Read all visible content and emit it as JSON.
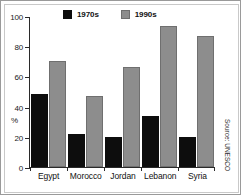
{
  "chart_data": {
    "type": "bar",
    "title": "",
    "xlabel": "",
    "ylabel": "%",
    "ylim": [
      0,
      100
    ],
    "yticks": [
      0,
      20,
      40,
      60,
      80,
      100
    ],
    "grid": false,
    "legend_position": "top",
    "categories": [
      "Egypt",
      "Morocco",
      "Jordan",
      "Lebanon",
      "Syria"
    ],
    "series": [
      {
        "name": "1970s",
        "color": "#0d0d0d",
        "values": [
          48.5,
          22,
          20,
          34,
          20
        ]
      },
      {
        "name": "1990s",
        "color": "#8d8d8d",
        "values": [
          70,
          47,
          66.5,
          93.5,
          86.5
        ]
      }
    ],
    "source_note": "Source: UNESCO"
  },
  "axis": {
    "tick_labels": [
      "100",
      "80",
      "60",
      "40",
      "20",
      "0"
    ],
    "unit_label": "%"
  },
  "legend": {
    "items": [
      {
        "label": "1970s"
      },
      {
        "label": "1990s"
      }
    ]
  },
  "source": {
    "text": "Source: UNESCO"
  }
}
